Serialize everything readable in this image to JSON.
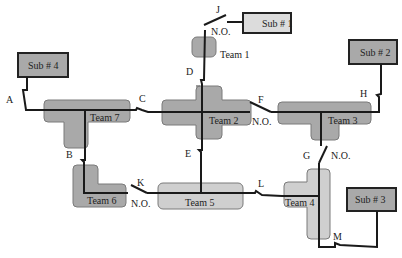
{
  "diagram": {
    "substations": [
      {
        "id": "sub1",
        "label": "Sub # 1",
        "fill": "#dcdcdc"
      },
      {
        "id": "sub2",
        "label": "Sub # 2",
        "fill": "#a9a9a9"
      },
      {
        "id": "sub3",
        "label": "Sub # 3",
        "fill": "#a9a9a9"
      },
      {
        "id": "sub4",
        "label": "Sub # 4",
        "fill": "#a9a9a9"
      }
    ],
    "teams": [
      {
        "id": "team1",
        "label": "Team 1"
      },
      {
        "id": "team2",
        "label": "Team 2"
      },
      {
        "id": "team3",
        "label": "Team 3"
      },
      {
        "id": "team4",
        "label": "Team 4"
      },
      {
        "id": "team5",
        "label": "Team 5"
      },
      {
        "id": "team6",
        "label": "Team 6"
      },
      {
        "id": "team7",
        "label": "Team 7"
      }
    ],
    "switches": {
      "A": "A",
      "B": "B",
      "C": "C",
      "D": "D",
      "E": "E",
      "F": "F",
      "G": "G",
      "H": "H",
      "J": "J",
      "K": "K",
      "L": "L",
      "M": "M"
    },
    "normally_open_label": "N.O.",
    "colors": {
      "team_fill": "#a9a9a9",
      "team_light_fill": "#cfcfcf",
      "line": "#1a1a1a"
    }
  }
}
